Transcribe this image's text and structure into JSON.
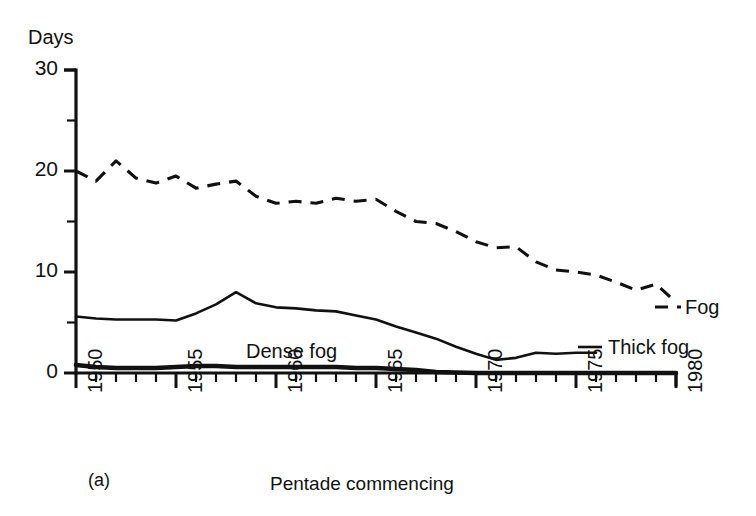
{
  "figure": {
    "panel_label": "(a)",
    "y_axis_label": "Days",
    "x_axis_title": "Pentade commencing"
  },
  "series_labels": {
    "fog": "Fog",
    "thick_fog": "Thick fog",
    "dense_fog": "Dense fog"
  },
  "chart_data": {
    "type": "line",
    "title": "",
    "subtitle": "",
    "xlabel": "Pentade commencing",
    "ylabel": "Days",
    "panel": "(a)",
    "xlim": [
      1950,
      1980
    ],
    "ylim": [
      0,
      30
    ],
    "grid": false,
    "legend_position": "inline-right",
    "x_major_ticks": [
      1950,
      1955,
      1960,
      1965,
      1970,
      1975,
      1980
    ],
    "x_tick_labels": [
      "1950",
      "1955",
      "1960",
      "1965",
      "1970",
      "1975",
      "1980"
    ],
    "x_minor_tick_interval": 1,
    "y_major_ticks": [
      0,
      10,
      20,
      30
    ],
    "y_tick_labels": [
      "0",
      "10",
      "20",
      "30"
    ],
    "y_minor_ticks": [
      5,
      15,
      25
    ],
    "x": [
      1950,
      1951,
      1952,
      1953,
      1954,
      1955,
      1956,
      1957,
      1958,
      1959,
      1960,
      1961,
      1962,
      1963,
      1964,
      1965,
      1966,
      1967,
      1968,
      1969,
      1970,
      1971,
      1972,
      1973,
      1974,
      1975,
      1976,
      1977,
      1978,
      1979,
      1980
    ],
    "series": [
      {
        "name": "Fog",
        "style": "dashed",
        "values": [
          20.0,
          19.0,
          21.0,
          19.3,
          18.8,
          19.5,
          18.3,
          18.7,
          19.0,
          17.5,
          16.8,
          17.0,
          16.8,
          17.3,
          17.0,
          17.2,
          16.0,
          15.0,
          14.8,
          14.0,
          13.0,
          12.4,
          12.5,
          11.0,
          10.2,
          10.0,
          9.7,
          9.0,
          8.2,
          8.8,
          7.0
        ]
      },
      {
        "name": "Thick fog",
        "style": "solid",
        "values": [
          5.6,
          5.4,
          5.3,
          5.3,
          5.3,
          5.2,
          5.9,
          6.8,
          8.0,
          6.9,
          6.5,
          6.4,
          6.2,
          6.1,
          5.7,
          5.3,
          4.6,
          4.0,
          3.4,
          2.6,
          1.9,
          1.3,
          1.5,
          2.0,
          1.9,
          2.0,
          2.0,
          null,
          null,
          null,
          null
        ]
      },
      {
        "name": "Dense fog",
        "style": "bold",
        "values": [
          0.8,
          0.6,
          0.5,
          0.5,
          0.5,
          0.6,
          0.7,
          0.7,
          0.6,
          0.6,
          0.6,
          0.6,
          0.6,
          0.6,
          0.5,
          0.5,
          0.4,
          0.3,
          0.1,
          0.05,
          0.0,
          0.0,
          0.0,
          0.0,
          0.0,
          0.0,
          0.0,
          0.0,
          0.0,
          0.0,
          0.0
        ]
      }
    ]
  },
  "colors": {
    "ink": "#111111",
    "background": "#ffffff"
  }
}
